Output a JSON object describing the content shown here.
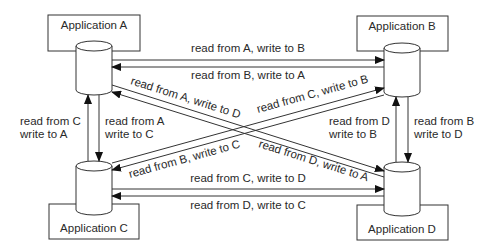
{
  "diagram": {
    "type": "replication-topology",
    "applications": [
      {
        "id": "A",
        "label": "Application A"
      },
      {
        "id": "B",
        "label": "Application B"
      },
      {
        "id": "C",
        "label": "Application C"
      },
      {
        "id": "D",
        "label": "Application D"
      }
    ],
    "flows": {
      "a_to_b": "read from A, write to B",
      "b_to_a": "read from B, write to A",
      "c_to_d": "read from C, write to D",
      "d_to_c": "read from D, write to C",
      "a_to_d": "read from A, write to D",
      "d_to_a": "read from D, write to A",
      "c_to_b": "read from C, write to B",
      "b_to_c": "read from B, write to C",
      "c_to_a": {
        "line1": "read from C",
        "line2": "write to A"
      },
      "a_to_c": {
        "line1": "read from A",
        "line2": "write to C"
      },
      "d_to_b": {
        "line1": "read from D",
        "line2": "write to B"
      },
      "b_to_d": {
        "line1": "read from B",
        "line2": "write to D"
      }
    },
    "colors": {
      "stroke": "#333333",
      "text": "#2a2a2a",
      "background": "#ffffff"
    }
  }
}
